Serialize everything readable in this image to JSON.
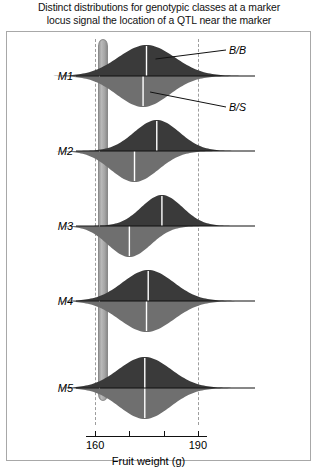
{
  "caption": {
    "line1": "Distinct distributions for genotypic classes at a marker",
    "line2": "locus signal the location of a QTL near the marker"
  },
  "chart_data": {
    "type": "area",
    "title": "Distinct distributions for genotypic classes at a marker locus signal the location of a QTL near the marker",
    "xlabel": "Fruit weight (g)",
    "ylabel": "",
    "grid": false,
    "legend_position": "inline-callout",
    "x_axis": {
      "tick_values": [
        160,
        170,
        180,
        190
      ],
      "tick_labels": [
        "160",
        "",
        "",
        "190"
      ],
      "xlim": [
        148,
        202
      ]
    },
    "reference_lines": [
      160,
      190
    ],
    "series": [
      {
        "name": "B/B",
        "color": "#3a3a3a",
        "orientation": "up"
      },
      {
        "name": "B/S",
        "color": "#6f6f6f",
        "orientation": "down"
      }
    ],
    "markers": [
      {
        "name": "M1",
        "bb_mean": 175.0,
        "bb_sd": 8.2,
        "bs_mean": 174.0,
        "bs_sd": 7.6,
        "separation": 1.0
      },
      {
        "name": "M2",
        "bb_mean": 178.0,
        "bb_sd": 6.6,
        "bs_mean": 171.5,
        "bs_sd": 6.9,
        "separation": 6.5
      },
      {
        "name": "M3",
        "bb_mean": 179.5,
        "bb_sd": 6.0,
        "bs_mean": 170.0,
        "bs_sd": 6.2,
        "separation": 9.5
      },
      {
        "name": "M4",
        "bb_mean": 175.5,
        "bb_sd": 7.4,
        "bs_mean": 175.0,
        "bs_sd": 7.8,
        "separation": 0.5
      },
      {
        "name": "M5",
        "bb_mean": 174.5,
        "bb_sd": 7.6,
        "bs_mean": 174.5,
        "bs_sd": 7.4,
        "separation": 0.0
      }
    ],
    "callouts": [
      {
        "label": "B/B",
        "target_marker": "M1",
        "target_series": "B/B"
      },
      {
        "label": "B/S",
        "target_marker": "M1",
        "target_series": "B/S"
      }
    ]
  },
  "axis": {
    "title": "Fruit weight (g)",
    "tick_labels": [
      "160",
      "190"
    ]
  },
  "colors": {
    "bb_fill": "#3a3a3a",
    "bs_fill": "#6f6f6f",
    "mean_line": "#ffffff",
    "chromosome": "#a8a8a8",
    "axis": "#111111",
    "reference_line": "#9d9d9d",
    "frame": "#a8a8a8"
  }
}
